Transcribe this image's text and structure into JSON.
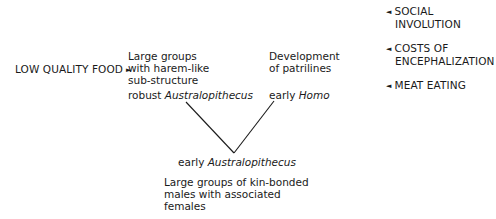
{
  "diagram": {
    "driver_left": {
      "label": "LOW QUALITY FOOD",
      "arrow": "►"
    },
    "drivers_right": [
      {
        "arrow": "◄",
        "line1": "SOCIAL",
        "line2": "INVOLUTION"
      },
      {
        "arrow": "◄",
        "line1": "COSTS OF",
        "line2": "ENCEPHALIZATION"
      },
      {
        "arrow": "◄",
        "line1": "MEAT EATING",
        "line2": ""
      }
    ],
    "branch_left": {
      "description_lines": [
        "Large groups",
        "with harem-like",
        "sub-structure"
      ],
      "taxon_prefix": "robust ",
      "taxon_italic": "Australopithecus"
    },
    "branch_right": {
      "description_lines": [
        "Development",
        "of patrilines"
      ],
      "taxon_prefix": "early ",
      "taxon_italic": "Homo"
    },
    "root": {
      "taxon_prefix": "early ",
      "taxon_italic": "Australopithecus",
      "description_lines": [
        "Large groups of kin-bonded",
        "males with associated",
        "females"
      ]
    },
    "line_color": "#1a1a1a"
  }
}
